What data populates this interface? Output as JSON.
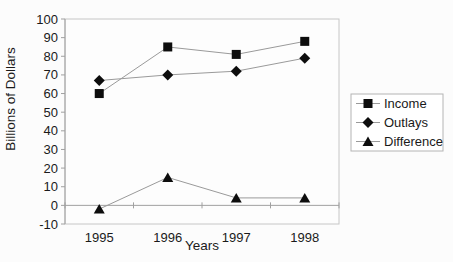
{
  "chart_data": {
    "type": "line",
    "title": "",
    "xlabel": "Years",
    "ylabel": "Billions of Dollars",
    "categories": [
      "1995",
      "1996",
      "1997",
      "1998"
    ],
    "series": [
      {
        "name": "Income",
        "marker": "square",
        "values": [
          60,
          85,
          81,
          88
        ]
      },
      {
        "name": "Outlays",
        "marker": "diamond",
        "values": [
          67,
          70,
          72,
          79
        ]
      },
      {
        "name": "Difference",
        "marker": "triangle",
        "values": [
          -2,
          15,
          4,
          4
        ]
      }
    ],
    "ylim": [
      -10,
      100
    ],
    "ytick_step": 10,
    "axis_crosses_at": 0,
    "grid": false,
    "legend_position": "right",
    "legend_labels": [
      "Income",
      "Outlays",
      "Difference"
    ]
  },
  "style": {
    "background": "#fcfcfc",
    "plot_fill": "#fdfdfd",
    "marker_color": "#0d0d0d",
    "series_line_color": "#9a9a9a",
    "axis_color": "#a0a0a0",
    "frame_color": "#c6c6c6",
    "legend_border_color": "#b4b4b4",
    "legend_fill": "#ffffff",
    "text_color": "#1a1a1a"
  }
}
